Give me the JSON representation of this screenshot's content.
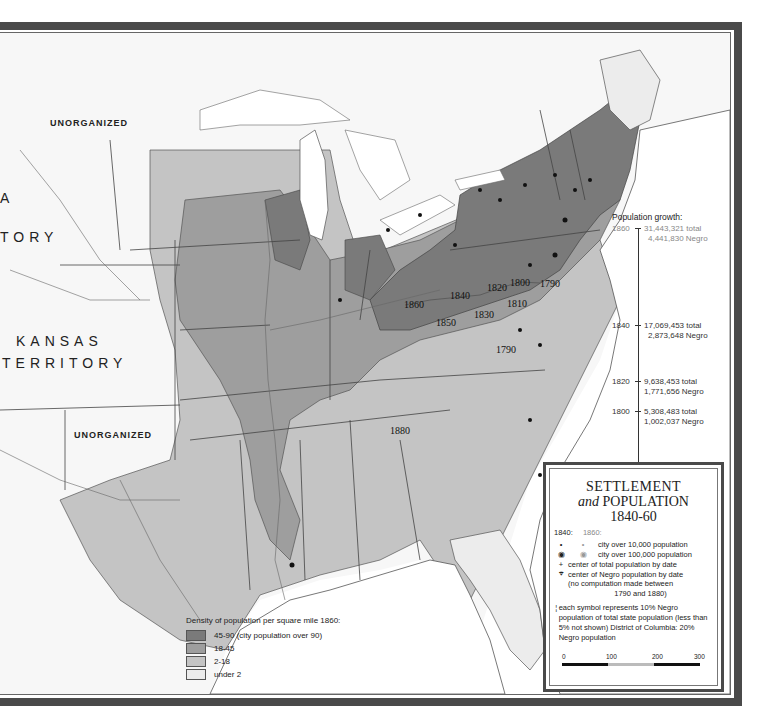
{
  "map": {
    "territory_labels": [
      {
        "text": "UNORGANIZED",
        "x": 50,
        "y": 118,
        "size": "small"
      },
      {
        "text": "A",
        "x": 0,
        "y": 190,
        "size": "big"
      },
      {
        "text": "TORY",
        "x": 0,
        "y": 229,
        "size": "big"
      },
      {
        "text": "KANSAS",
        "x": 16,
        "y": 333,
        "size": "big"
      },
      {
        "text": "TERRITORY",
        "x": 2,
        "y": 355,
        "size": "big"
      },
      {
        "text": "UNORGANIZED",
        "x": 74,
        "y": 430,
        "size": "small"
      }
    ],
    "population_center_dates": [
      {
        "text": "1860",
        "x": 404,
        "y": 299
      },
      {
        "text": "1840",
        "x": 450,
        "y": 290
      },
      {
        "text": "1850",
        "x": 436,
        "y": 317
      },
      {
        "text": "1830",
        "x": 474,
        "y": 309
      },
      {
        "text": "1820",
        "x": 487,
        "y": 282
      },
      {
        "text": "1800",
        "x": 510,
        "y": 277
      },
      {
        "text": "1790",
        "x": 540,
        "y": 278
      },
      {
        "text": "1810",
        "x": 507,
        "y": 298
      },
      {
        "text": "1790",
        "x": 496,
        "y": 344
      },
      {
        "text": "1880",
        "x": 390,
        "y": 425
      }
    ]
  },
  "population_growth": {
    "title": "Population growth:",
    "entries": [
      {
        "year": "1860",
        "total": "31,443,321 total",
        "negro": "4,441,830 Negro",
        "faded": true
      },
      {
        "year": "1840",
        "total": "17,069,453 total",
        "negro": "2,873,648 Negro",
        "faded": false
      },
      {
        "year": "1820",
        "total": "9,638,453 total",
        "negro": "1,771,656 Negro",
        "faded": false
      },
      {
        "year": "1800",
        "total": "5,308,483 total",
        "negro": "1,002,037 Negro",
        "faded": false
      }
    ]
  },
  "density_legend": {
    "title": "Density of population per square mile 1860:",
    "items": [
      {
        "label": "45-90 (city population over 90)",
        "color": "#7a7a7a"
      },
      {
        "label": "18-45",
        "color": "#9e9e9e"
      },
      {
        "label": "2-18",
        "color": "#c4c4c4"
      },
      {
        "label": "under 2",
        "color": "#ececec"
      }
    ]
  },
  "settlement_box": {
    "title_line1": "SETTLEMENT",
    "title_and": "and",
    "title_line2": "POPULATION",
    "title_line3": "1840-60",
    "year_a": "1840:",
    "year_b": "1860:",
    "keys": [
      {
        "sym_a": "•",
        "sym_b": "•",
        "label": "city over 10,000 population"
      },
      {
        "sym_a": "◉",
        "sym_b": "◉",
        "label": "city over 100,000 population"
      },
      {
        "sym_a": "+",
        "sym_b": "",
        "label": "center of total population by date"
      },
      {
        "sym_a": "⌖",
        "sym_b": "",
        "label": "center of Negro population by date"
      }
    ],
    "note_1": "(no computation made between",
    "note_2": "1790 and 1880)",
    "symbol_note": "each symbol represents 10% Negro population of total state population (less than 5% not shown) District of Columbia: 20% Negro population",
    "scale": {
      "ticks": [
        "0",
        "100",
        "200",
        "300"
      ]
    }
  },
  "colors": {
    "frame": "#4a4a4a",
    "dense": "#7a7a7a",
    "medium": "#9e9e9e",
    "light": "#c4c4c4",
    "sparse": "#ececec",
    "water": "#ffffff"
  }
}
